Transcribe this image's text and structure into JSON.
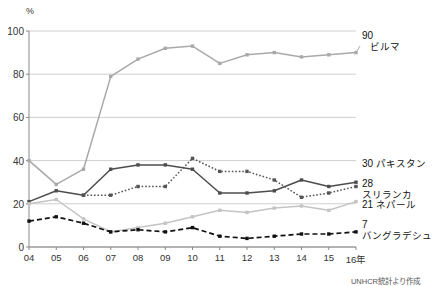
{
  "chart_data": {
    "type": "line",
    "title": "",
    "xlabel": "",
    "ylabel": "%",
    "y_unit": "%",
    "ylim": [
      0,
      100
    ],
    "yticks": [
      0,
      20,
      40,
      60,
      80,
      100
    ],
    "grid": true,
    "legend_position": "right-inline-endpoint-labels",
    "x": [
      "04",
      "05",
      "06",
      "07",
      "08",
      "09",
      "10",
      "11",
      "12",
      "13",
      "14",
      "15",
      "16年"
    ],
    "xtick_labels": [
      "04",
      "05",
      "06",
      "07",
      "08",
      "09",
      "10",
      "11",
      "12",
      "13",
      "14",
      "15",
      "16年"
    ],
    "categories": [
      2004,
      2005,
      2006,
      2007,
      2008,
      2009,
      2010,
      2011,
      2012,
      2013,
      2014,
      2015,
      2016
    ],
    "series": [
      {
        "name": "ビルマ",
        "name_en": "Burma",
        "end_value": 90,
        "end_label": "90",
        "color": "#a9a9a9",
        "style": "solid",
        "marker": "square",
        "values": [
          40,
          29,
          36,
          79,
          87,
          92,
          93,
          85,
          89,
          90,
          88,
          89,
          90
        ]
      },
      {
        "name": "パキスタン",
        "name_en": "Pakistan",
        "end_value": 30,
        "end_label": "30",
        "color": "#4d4d4d",
        "style": "solid",
        "marker": "square",
        "values": [
          21,
          26,
          24,
          36,
          38,
          38,
          36,
          25,
          25,
          26,
          31,
          28,
          30
        ]
      },
      {
        "name": "スリランカ",
        "name_en": "Sri Lanka",
        "end_value": 28,
        "end_label": "28",
        "color": "#555555",
        "style": "dotted",
        "marker": "square",
        "values": [
          null,
          null,
          24,
          24,
          28,
          28,
          41,
          35,
          35,
          31,
          23,
          25,
          28
        ]
      },
      {
        "name": "ネパール",
        "name_en": "Nepal",
        "end_value": 21,
        "end_label": "21",
        "color": "#c4c4c4",
        "style": "solid",
        "marker": "square",
        "values": [
          20,
          22,
          13,
          7,
          9,
          11,
          14,
          17,
          16,
          18,
          19,
          17,
          21
        ]
      },
      {
        "name": "バングラデシュ",
        "name_en": "Bangladesh",
        "end_value": 7,
        "end_label": "7",
        "color": "#111111",
        "style": "dashed",
        "marker": "square",
        "values": [
          12,
          14,
          11,
          7,
          8,
          7,
          9,
          5,
          4,
          5,
          6,
          6,
          7
        ]
      }
    ]
  },
  "source": {
    "note": "UNHCR統計より作成"
  }
}
